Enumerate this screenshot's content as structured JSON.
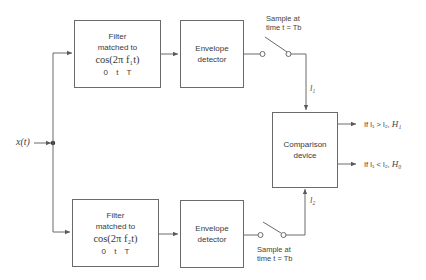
{
  "input": {
    "label": "x(t)"
  },
  "upper_branch": {
    "filter": {
      "line1": "Filter",
      "line2": "matched to",
      "formula": "cos(2π f₁t)",
      "range": "0 t T"
    },
    "detector": {
      "line1": "Envelope",
      "line2": "detector"
    },
    "sampler": {
      "line1": "Sample at",
      "line2": "time t = Tb"
    },
    "signal_label": "l₁"
  },
  "lower_branch": {
    "filter": {
      "line1": "Filter",
      "line2": "matched to",
      "formula": "cos(2π f₂t)",
      "range": "0 t T"
    },
    "detector": {
      "line1": "Envelope",
      "line2": "detector"
    },
    "sampler": {
      "line1": "Sample at",
      "line2": "time t = Tb"
    },
    "signal_label": "l₂"
  },
  "comparison": {
    "line1": "Comparison",
    "line2": "device"
  },
  "decisions": [
    {
      "condition": "If  l₁ > l₂,",
      "hypothesis": "H₁"
    },
    {
      "condition": "If  l₁ < l₂,",
      "hypothesis": "H₀"
    }
  ],
  "colors": {
    "line": "#6a6a6a",
    "text": "#3a3a3a",
    "background": "#ffffff"
  }
}
